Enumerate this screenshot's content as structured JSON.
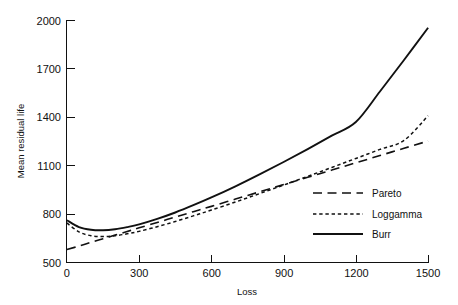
{
  "chart_data": {
    "type": "line",
    "title": "",
    "xlabel": "Loss",
    "ylabel": "Mean residual life",
    "xlim": [
      0,
      1500
    ],
    "ylim": [
      500,
      2000
    ],
    "xticks": [
      0,
      300,
      600,
      900,
      1200,
      1500
    ],
    "yticks": [
      500,
      800,
      1100,
      1400,
      1700,
      2000
    ],
    "xtick_labels": [
      "0",
      "300",
      "600",
      "900",
      "1200",
      "1500"
    ],
    "ytick_labels": [
      "500",
      "800",
      "1100",
      "1400",
      "1700",
      "2000"
    ],
    "grid": false,
    "legend_position": "center-right",
    "x": [
      0,
      50,
      100,
      150,
      200,
      250,
      300,
      375,
      450,
      525,
      600,
      700,
      800,
      900,
      1000,
      1100,
      1200,
      1300,
      1400,
      1500
    ],
    "series": [
      {
        "name": "Pareto",
        "style": "long-dash",
        "color": "#111111",
        "values": [
          580,
          602,
          625,
          647,
          670,
          692,
          715,
          748,
          782,
          815,
          848,
          893,
          938,
          983,
          1028,
          1073,
          1118,
          1163,
          1208,
          1253
        ]
      },
      {
        "name": "Loggamma",
        "style": "short-dash",
        "color": "#111111",
        "values": [
          745,
          690,
          666,
          661,
          666,
          678,
          693,
          722,
          754,
          789,
          825,
          875,
          927,
          980,
          1034,
          1089,
          1145,
          1201,
          1257,
          1410
        ]
      },
      {
        "name": "Burr",
        "style": "solid",
        "color": "#111111",
        "values": [
          762,
          720,
          703,
          700,
          706,
          719,
          736,
          770,
          810,
          855,
          903,
          972,
          1046,
          1123,
          1203,
          1286,
          1371,
          1560,
          1755,
          1955
        ]
      }
    ],
    "legend_entries": [
      {
        "label": "Pareto",
        "style": "long-dash"
      },
      {
        "label": "Loggamma",
        "style": "short-dash"
      },
      {
        "label": "Burr",
        "style": "solid"
      }
    ]
  }
}
